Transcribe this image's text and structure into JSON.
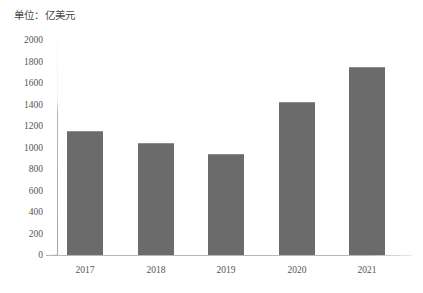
{
  "chart_data": {
    "type": "bar",
    "title": "",
    "subtitle": "",
    "unit_caption": "单位：亿美元",
    "xlabel": "",
    "ylabel": "",
    "categories": [
      "2017",
      "2018",
      "2019",
      "2020",
      "2021"
    ],
    "values": [
      1150,
      1040,
      940,
      1420,
      1750
    ],
    "series": [
      {
        "name": "亿美元",
        "values": [
          1150,
          1040,
          940,
          1420,
          1750
        ]
      }
    ],
    "ylim": [
      0,
      2000
    ],
    "ytick_labels": [
      "2000",
      "1800",
      "1600",
      "1400",
      "1200",
      "1000",
      "800",
      "600",
      "400",
      "200",
      "0"
    ],
    "ytick_values": [
      2000,
      1800,
      1600,
      1400,
      1200,
      1000,
      800,
      600,
      400,
      200,
      0
    ],
    "ytick_step": 200,
    "grid": false,
    "legend": false,
    "legend_position": "none",
    "bar_color": "#6b6b6b",
    "background_color": "#ffffff",
    "axis_color": "#aaaaaa",
    "text_color": "#555555"
  }
}
